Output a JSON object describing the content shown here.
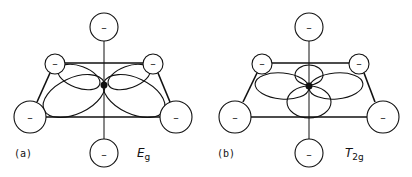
{
  "figure": {
    "ligand_charge_symbol": "–",
    "panels": [
      {
        "id": "a",
        "label": "(a)",
        "symmetry_main": "E",
        "symmetry_sub": "g",
        "orbital_orientation": "lobes pointing toward ligands"
      },
      {
        "id": "b",
        "label": "(b)",
        "symmetry_main": "T",
        "symmetry_sub": "2g",
        "orbital_orientation": "lobes pointing between ligands"
      }
    ]
  }
}
